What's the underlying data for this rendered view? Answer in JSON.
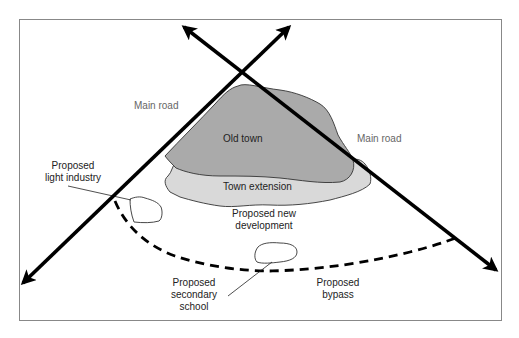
{
  "diagram": {
    "colors": {
      "old_town_fill": "#aaaaaa",
      "town_extension_fill": "#d9d9d9",
      "road": "#000000",
      "border": "#888888",
      "outline": "#333333"
    },
    "labels": {
      "main_road_left": "Main road",
      "main_road_right": "Main road",
      "old_town": "Old town",
      "town_extension": "Town extension",
      "new_development_line1": "Proposed new",
      "new_development_line2": "development",
      "light_industry_line1": "Proposed",
      "light_industry_line2": "light industry",
      "school_line1": "Proposed",
      "school_line2": "secondary",
      "school_line3": "school",
      "bypass_line1": "Proposed",
      "bypass_line2": "bypass"
    },
    "elements": [
      {
        "id": "main-road-1",
        "type": "road",
        "label": "Main road"
      },
      {
        "id": "main-road-2",
        "type": "road",
        "label": "Main road"
      },
      {
        "id": "old-town",
        "type": "area",
        "label": "Old town"
      },
      {
        "id": "town-extension",
        "type": "area",
        "label": "Town extension"
      },
      {
        "id": "light-industry",
        "type": "site",
        "label": "Proposed light industry"
      },
      {
        "id": "secondary-school",
        "type": "site",
        "label": "Proposed secondary school"
      },
      {
        "id": "new-development",
        "type": "zone",
        "label": "Proposed new development"
      },
      {
        "id": "bypass",
        "type": "road-proposed",
        "label": "Proposed bypass"
      }
    ]
  }
}
